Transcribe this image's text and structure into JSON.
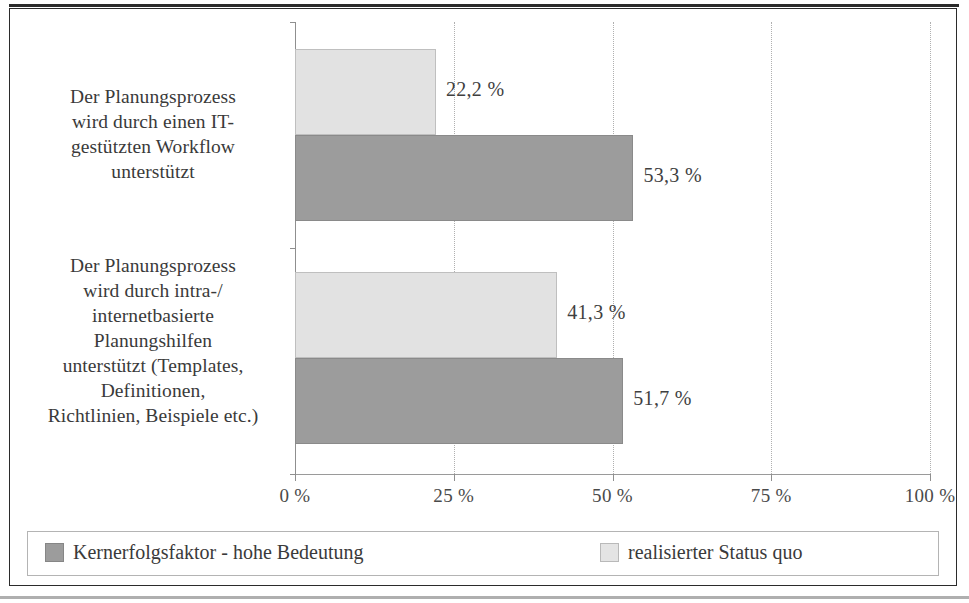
{
  "chart_data": {
    "type": "bar",
    "orientation": "horizontal",
    "title": "",
    "xlabel": "",
    "ylabel": "",
    "xlim": [
      0,
      100
    ],
    "grid": true,
    "grid_axis": "x",
    "legend_position": "bottom",
    "categories": [
      "Der Planungsprozess wird durch einen IT-gestützten Workflow unterstützt",
      "Der Planungsprozess wird durch intra-/ internetbasierte Planungshilfen unterstützt (Templates, Definitionen, Richtlinien, Beispiele etc.)"
    ],
    "category_lines": [
      [
        "Der Planungsprozess",
        "wird durch einen IT-",
        "gestützten Workflow",
        "unterstützt"
      ],
      [
        "Der Planungsprozess",
        "wird durch intra-/",
        "internetbasierte",
        "Planungshilfen",
        "unterstützt (Templates,",
        "Definitionen,",
        "Richtlinien, Beispiele etc.)"
      ]
    ],
    "series": [
      {
        "name": "Kernerfolgsfaktor - hohe Bedeutung",
        "color": "#9c9c9c",
        "values": [
          53.3,
          51.7
        ],
        "labels": [
          "53,3 %",
          "51,7 %"
        ]
      },
      {
        "name": "realisierter Status quo",
        "color": "#e2e2e2",
        "values": [
          22.2,
          41.3
        ],
        "labels": [
          "22,2 %",
          "41,3 %"
        ]
      }
    ],
    "xticks": [
      0,
      25,
      50,
      75,
      100
    ],
    "xticklabels": [
      "0 %",
      "25 %",
      "50 %",
      "75 %",
      "100 %"
    ]
  },
  "legend": {
    "items": [
      {
        "label": "Kernerfolgsfaktor - hohe Bedeutung",
        "swatch": "kern"
      },
      {
        "label": "realisierter Status quo",
        "swatch": "status"
      }
    ]
  }
}
